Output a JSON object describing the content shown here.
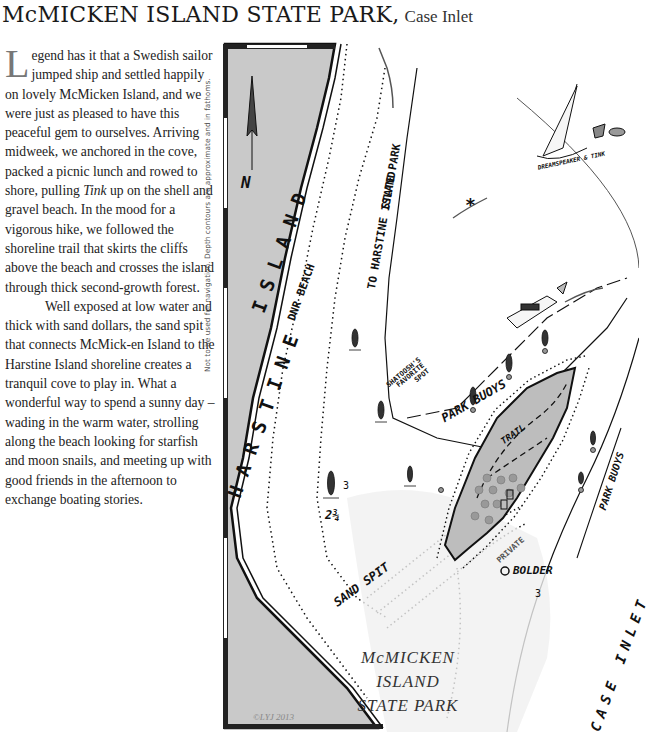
{
  "header": {
    "title": "McMICKEN ISLAND STATE PARK,",
    "subtitle": "Case Inlet"
  },
  "story": {
    "dropcap": "L",
    "paragraph1": "egend has it that a Swedish sailor jumped ship and settled happily on lovely McMicken Island, and we were just as pleased to have this peaceful gem to ourselves. Arriving midweek, we anchored in the cove, packed a picnic lunch and rowed to shore, pulling ",
    "paragraph1_italic": "Tink",
    "paragraph1_end": " up on the shell and gravel beach. In the mood for a vigorous hike, we followed the shoreline trail that skirts the cliffs above the beach and crosses the island through thick second-growth forest.",
    "paragraph2": "Well exposed at low water and thick with sand dollars, the sand spit that connects McMick-en Island to the Harstine Island shoreline creates a tranquil cove to play in. What a wonderful way to spend a sunny day – wading in the warm water, strolling along the beach looking for starfish and moon snails, and meeting up with good friends in the afternoon to exchange boating stories."
  },
  "disclaimer": "Not to be used for navigation. Depth contours are approximate and in fathoms.",
  "map": {
    "compass_label": "N",
    "labels": {
      "harstine_island": "HARSTINE ISLAND",
      "harstine_lower": "H A R S T I N E",
      "island_upper": "I S L A N D",
      "dnr_beach": "DNR BEACH",
      "to_harstine_park_1": "TO HARSTINE ISLAND",
      "to_harstine_park_2": "STATE PARK",
      "dreamspeaker": "DREAMSPEAKER & TINK",
      "shatoosh_1": "SHATOOSH'S",
      "shatoosh_2": "FAVORITE",
      "shatoosh_3": "SPOT",
      "park_buoys_north": "PARK BUOYS",
      "park_buoys_east": "PARK BUOYS",
      "trail": "TRAIL",
      "private": "PRIVATE",
      "bolder": "BOLDER",
      "sand_spit": "SAND SPIT",
      "case_inlet": "CASE  INLET",
      "depth_2_3_4": "2¾",
      "depth_3_a": "3",
      "depth_3_b": "3",
      "star": "*"
    },
    "park_label": {
      "line1": "McMICKEN",
      "line2": "ISLAND",
      "line3": "STATE PARK"
    },
    "copyright": "©LYJ 2013",
    "colors": {
      "land": "#c9c9c9",
      "island_fill": "#bdbdbd",
      "water": "#f4f4f4",
      "ink": "#111111"
    }
  }
}
